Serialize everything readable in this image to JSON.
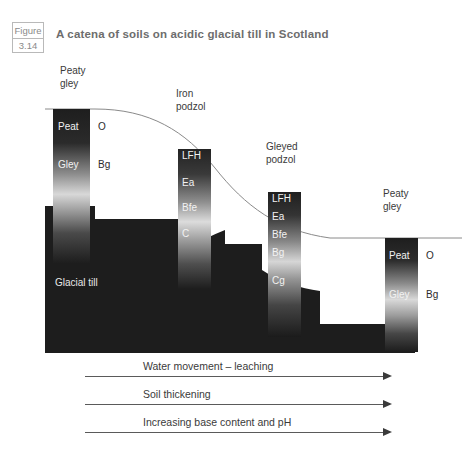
{
  "figure": {
    "word": "Figure",
    "number": "3.14",
    "title": "A catena of soils on acidic glacial till in Scotland"
  },
  "diagram": {
    "substrate_label": "Glacial till",
    "profiles": [
      {
        "name": "peaty-gley-upper",
        "title_line1": "Peaty",
        "title_line2": "gley",
        "horizons_inner": [
          "Peat",
          "Gley"
        ],
        "horizons_outer": [
          "O",
          "Bg"
        ]
      },
      {
        "name": "iron-podzol",
        "title_line1": "Iron",
        "title_line2": "podzol",
        "horizons_inner": [
          "LFH",
          "Ea",
          "Bfe",
          "C"
        ],
        "horizons_outer": []
      },
      {
        "name": "gleyed-podzol",
        "title_line1": "Gleyed",
        "title_line2": "podzol",
        "horizons_inner": [
          "LFH",
          "Ea",
          "Bfe",
          "Bg",
          "Cg"
        ],
        "horizons_outer": []
      },
      {
        "name": "peaty-gley-lower",
        "title_line1": "Peaty",
        "title_line2": "gley",
        "horizons_inner": [
          "Peat",
          "Gley"
        ],
        "horizons_outer": [
          "O",
          "Bg"
        ]
      }
    ]
  },
  "arrows": [
    {
      "label": "Water movement – leaching"
    },
    {
      "label": "Soil thickening"
    },
    {
      "label": "Increasing base content and pH"
    }
  ],
  "colors": {
    "till_dark": "#1d1d1d",
    "column_light": "#f0f0f0",
    "column_dark": "#202020",
    "ground_line": "#7a7a7a",
    "title_gray": "#6d6d6d",
    "box_border": "#b9b9b9"
  }
}
